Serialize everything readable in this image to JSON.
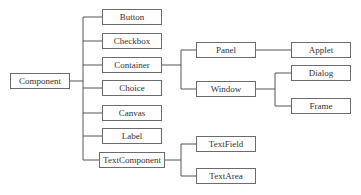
{
  "diagram": {
    "type": "class-hierarchy-tree",
    "root": "Component",
    "nodes": {
      "component": "Component",
      "button": "Button",
      "checkbox": "Checkbox",
      "container": "Container",
      "choice": "Choice",
      "canvas": "Canvas",
      "label": "Label",
      "textcomponent": "TextComponent",
      "panel": "Panel",
      "window": "Window",
      "applet": "Applet",
      "dialog": "Dialog",
      "frame": "Frame",
      "textfield": "TextField",
      "textarea": "TextArea"
    },
    "edges": [
      [
        "Component",
        "Button"
      ],
      [
        "Component",
        "Checkbox"
      ],
      [
        "Component",
        "Container"
      ],
      [
        "Component",
        "Choice"
      ],
      [
        "Component",
        "Canvas"
      ],
      [
        "Component",
        "Label"
      ],
      [
        "Component",
        "TextComponent"
      ],
      [
        "Container",
        "Panel"
      ],
      [
        "Container",
        "Window"
      ],
      [
        "Panel",
        "Applet"
      ],
      [
        "Window",
        "Dialog"
      ],
      [
        "Window",
        "Frame"
      ],
      [
        "TextComponent",
        "TextField"
      ],
      [
        "TextComponent",
        "TextArea"
      ]
    ],
    "colors": {
      "border": "#6b6b6b",
      "line": "#555555",
      "text": "#333333",
      "background": "#ffffff"
    }
  }
}
